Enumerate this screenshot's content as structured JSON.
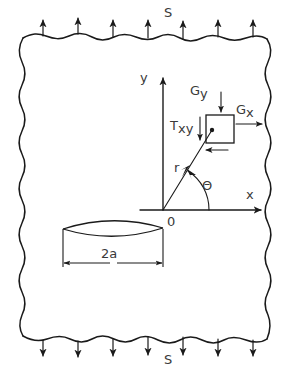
{
  "figure": {
    "background_color": "#ffffff",
    "line_color": "#1a1a1a",
    "text_color": "#3a3a3a"
  },
  "labels": {
    "remote_stress_top": "S",
    "remote_stress_bottom": "S",
    "axis_y": "y",
    "axis_x": "x",
    "origin": "0",
    "radius": "r",
    "angle": "Θ",
    "sigma_y": "G",
    "sigma_y_sub": "y",
    "sigma_x": "G",
    "sigma_x_sub": "x",
    "tau_xy": "T",
    "tau_xy_sub": "xy",
    "crack_length": "2a"
  },
  "geometry": {
    "plate": {
      "left": 22,
      "right": 268,
      "top": 32,
      "bottom": 341
    },
    "origin": {
      "x": 163,
      "y": 210
    },
    "element": {
      "x": 206,
      "y": 115,
      "width": 28,
      "height": 28
    },
    "crack": {
      "center_x": 113,
      "center_y": 229,
      "half_length": 50,
      "half_height": 9
    },
    "angle_degrees": 52,
    "radius_length": 72,
    "top_arrow_count": 7,
    "bottom_arrow_count": 7
  },
  "annotations": {
    "description": "Infinite plate containing a central crack of length 2a subjected to uniform remote tensile stress S applied normal to the crack plane on the top and bottom edges. A differential stress element located at polar coordinates r and theta from the crack tip origin carries normal stresses sigma-x and sigma-y and shear stress tau-xy."
  }
}
